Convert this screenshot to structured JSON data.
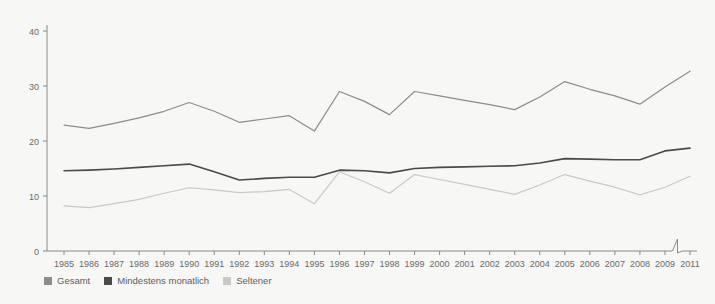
{
  "chart_data": {
    "type": "line",
    "title": "",
    "subtitle": "",
    "xlabel": "",
    "ylabel": "",
    "ylim": [
      0,
      40
    ],
    "yticks": [
      0,
      10,
      20,
      30,
      40
    ],
    "grid": false,
    "legend_position": "bottom-left",
    "axis_break_after": "2009",
    "categories": [
      "1985",
      "1986",
      "1987",
      "1988",
      "1989",
      "1990",
      "1991",
      "1992",
      "1993",
      "1994",
      "1995",
      "1996",
      "1997",
      "1998",
      "1999",
      "2000",
      "2001",
      "2002",
      "2003",
      "2004",
      "2005",
      "2006",
      "2007",
      "2008",
      "2009",
      "2011"
    ],
    "series": [
      {
        "name": "Gesamt",
        "color": "#8c8c8c",
        "values": [
          22.9,
          22.3,
          23.2,
          24.2,
          25.4,
          27.0,
          25.4,
          23.4,
          24.0,
          24.6,
          21.8,
          29.0,
          27.2,
          24.8,
          29.0,
          28.2,
          27.4,
          26.6,
          25.7,
          28.0,
          30.8,
          29.4,
          28.2,
          26.7,
          29.8,
          32.7
        ]
      },
      {
        "name": "Mindestens monatlich",
        "color": "#4a4a4a",
        "values": [
          14.6,
          14.7,
          14.9,
          15.2,
          15.5,
          15.8,
          14.4,
          12.9,
          13.2,
          13.4,
          13.4,
          14.7,
          14.6,
          14.2,
          15.0,
          15.2,
          15.3,
          15.4,
          15.5,
          16.0,
          16.8,
          16.7,
          16.6,
          16.6,
          18.2,
          18.7
        ]
      },
      {
        "name": "Seltener",
        "color": "#c9c9c9",
        "values": [
          8.2,
          7.9,
          8.6,
          9.4,
          10.5,
          11.5,
          11.1,
          10.6,
          10.8,
          11.2,
          8.6,
          14.4,
          12.6,
          10.5,
          13.9,
          13.0,
          12.1,
          11.2,
          10.3,
          12.0,
          13.9,
          12.7,
          11.6,
          10.2,
          11.6,
          13.6
        ]
      }
    ]
  },
  "legend": {
    "items": [
      {
        "label": "Gesamt",
        "color": "#8c8c8c"
      },
      {
        "label": "Mindestens monatlich",
        "color": "#4a4a4a"
      },
      {
        "label": "Seltener",
        "color": "#c9c9c9"
      }
    ]
  }
}
